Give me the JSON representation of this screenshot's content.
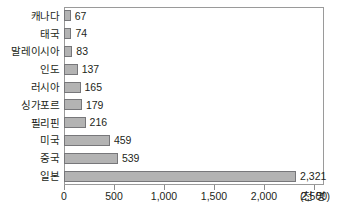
{
  "chart_data": {
    "type": "bar",
    "orientation": "horizontal",
    "title": "",
    "xlabel": "(천 명)",
    "ylabel": "",
    "xlim": [
      0,
      2600
    ],
    "grid": false,
    "legend": null,
    "xticks": [
      0,
      500,
      1000,
      1500,
      2000,
      2500
    ],
    "xticklabels": [
      "0",
      "500",
      "1,000",
      "1,500",
      "2,000",
      "2,500"
    ],
    "categories": [
      "캐나다",
      "태국",
      "말레이시아",
      "인도",
      "러시아",
      "싱가포르",
      "필리핀",
      "미국",
      "중국",
      "일본"
    ],
    "values": [
      67,
      74,
      83,
      137,
      165,
      179,
      216,
      459,
      539,
      2321
    ],
    "value_labels": [
      "67",
      "74",
      "83",
      "137",
      "165",
      "179",
      "216",
      "459",
      "539",
      "2,321"
    ],
    "colors": {
      "bar_fill": "#b3b3b3",
      "bar_border": "#77777a",
      "frame": "#9a9a9a",
      "text": "#231f20",
      "background": "#ffffff"
    }
  }
}
